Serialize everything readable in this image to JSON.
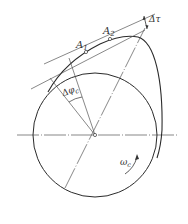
{
  "diagram": {
    "type": "cam-profile-geometry",
    "colors": {
      "stroke": "#2a2a2a",
      "thin": "#555555",
      "background": "#ffffff"
    },
    "labels": {
      "point_a1": "A",
      "point_a1_sub": "1",
      "point_a2": "A",
      "point_a2_sub": "2",
      "delta_tau": "Δτ",
      "delta_phi": "Δφ",
      "delta_phi_sub": "c",
      "omega": "ω",
      "omega_sub": "c"
    }
  }
}
